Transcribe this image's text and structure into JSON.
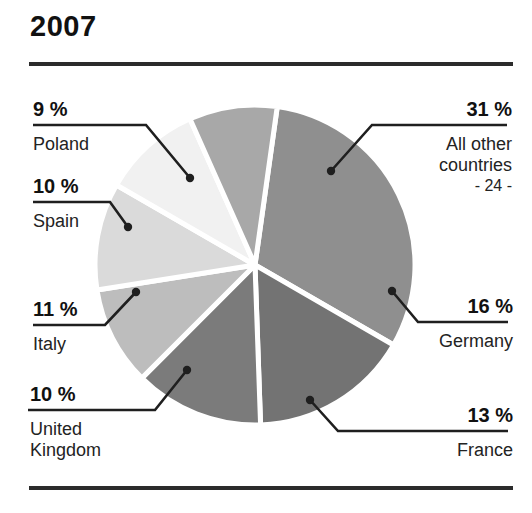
{
  "header": {
    "title": "2007"
  },
  "chart_data": {
    "type": "pie",
    "title": "2007",
    "xlabel": "",
    "ylabel": "",
    "legend_position": "callout-labels",
    "grid": false,
    "unit": "%",
    "center": {
      "x": 255,
      "y": 265
    },
    "radius": 160,
    "slices": [
      {
        "name": "All other countries",
        "sublabel": "- 24 -",
        "value": 31,
        "percent_label": "31 %",
        "color": "#8f8f8f",
        "start_angle": 8,
        "end_angle": 120,
        "label_side": "right",
        "label_x": 424,
        "label_y": 98,
        "underline_x1": 372,
        "underline_x2": 507,
        "underline_y": 125,
        "dot_x": 331,
        "dot_y": 171
      },
      {
        "name": "Germany",
        "sublabel": "",
        "value": 16,
        "percent_label": "16 %",
        "color": "#737373",
        "start_angle": 120,
        "end_angle": 178,
        "label_side": "right",
        "label_x": 444,
        "label_y": 295,
        "underline_x1": 418,
        "underline_x2": 508,
        "underline_y": 322,
        "dot_x": 392,
        "dot_y": 291
      },
      {
        "name": "France",
        "sublabel": "",
        "value": 13,
        "percent_label": "13 %",
        "color": "#7b7b7b",
        "start_angle": 178,
        "end_angle": 225,
        "label_side": "right",
        "label_x": 444,
        "label_y": 404,
        "underline_x1": 338,
        "underline_x2": 508,
        "underline_y": 431,
        "dot_x": 310,
        "dot_y": 400
      },
      {
        "name": "United Kingdom",
        "sublabel": "",
        "value": 10,
        "percent_label": "10 %",
        "color": "#bdbdbd",
        "start_angle": 225,
        "end_angle": 261,
        "label_side": "left",
        "label_x": 30,
        "label_y": 383,
        "underline_x1": 28,
        "underline_x2": 155,
        "underline_y": 410,
        "dot_x": 187,
        "dot_y": 370
      },
      {
        "name": "Italy",
        "sublabel": "",
        "value": 11,
        "percent_label": "11 %",
        "color": "#dadada",
        "start_angle": 261,
        "end_angle": 300,
        "label_side": "left",
        "label_x": 33,
        "label_y": 298,
        "underline_x1": 33,
        "underline_x2": 105,
        "underline_y": 325,
        "dot_x": 136,
        "dot_y": 292
      },
      {
        "name": "Spain",
        "sublabel": "",
        "value": 10,
        "percent_label": "10 %",
        "color": "#f1f1f1",
        "start_angle": 300,
        "end_angle": 336,
        "label_side": "left",
        "label_x": 33,
        "label_y": 175,
        "underline_x1": 33,
        "underline_x2": 110,
        "underline_y": 202,
        "dot_x": 128,
        "dot_y": 227
      },
      {
        "name": "Poland",
        "sublabel": "",
        "value": 9,
        "percent_label": "9 %",
        "color": "#a8a8a8",
        "start_angle": 336,
        "end_angle": 368,
        "label_side": "left",
        "label_x": 33,
        "label_y": 98,
        "underline_x1": 33,
        "underline_x2": 146,
        "underline_y": 125,
        "dot_x": 190,
        "dot_y": 178
      }
    ]
  },
  "style": {
    "rule_color": "#2b2b2b",
    "leader_color": "#1f1f1f",
    "slice_gap_color": "#ffffff",
    "background": "#ffffff"
  }
}
